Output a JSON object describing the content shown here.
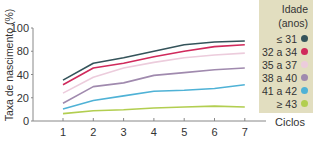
{
  "chart_data": {
    "type": "line",
    "title": "",
    "xlabel": "Ciclos",
    "ylabel": "Taxa de nascimento (%)",
    "x": [
      1,
      2,
      3,
      4,
      5,
      6,
      7
    ],
    "y_tick_labels": [
      "100",
      "80",
      "40",
      "20",
      "0"
    ],
    "ylim": [
      0,
      100
    ],
    "grid": false,
    "legend_position": "top-right",
    "legend_title": [
      "Idade",
      "(anos)"
    ],
    "series": [
      {
        "name": "≤ 31",
        "color": "#34535a",
        "values": [
          44,
          62,
          68,
          75,
          82,
          85,
          86
        ]
      },
      {
        "name": "32 a 34",
        "color": "#d02a5c",
        "values": [
          39,
          57,
          62,
          69,
          75,
          80,
          82
        ]
      },
      {
        "name": "35 a 37",
        "color": "#ecccdc",
        "values": [
          30,
          47,
          57,
          63,
          68,
          71,
          73
        ]
      },
      {
        "name": "38 a 40",
        "color": "#a08aae",
        "values": [
          19,
          37,
          41,
          49,
          52,
          55,
          57
        ]
      },
      {
        "name": "41 a 42",
        "color": "#4fb2d6",
        "values": [
          13,
          22,
          27,
          32,
          33,
          35,
          39
        ]
      },
      {
        "name": "≥ 43",
        "color": "#b2ce50",
        "values": [
          8,
          11,
          12,
          14,
          15,
          16,
          15
        ]
      }
    ]
  },
  "axes": {
    "ylabel": "Taxa de nascimento (%)",
    "xlabel": "Ciclos",
    "x_ticks": [
      "1",
      "2",
      "3",
      "4",
      "5",
      "6",
      "7"
    ],
    "y_ticks": [
      "100",
      "80",
      "40",
      "20",
      "0"
    ]
  },
  "legend": {
    "title_line1": "Idade",
    "title_line2": "(anos)",
    "items": [
      {
        "label": "≤ 31",
        "color": "#34535a"
      },
      {
        "label": "32 a 34",
        "color": "#d02a5c"
      },
      {
        "label": "35 a 37",
        "color": "#ecccdc"
      },
      {
        "label": "38 a 40",
        "color": "#a08aae"
      },
      {
        "label": "41 a 42",
        "color": "#4fb2d6"
      },
      {
        "label": "≥ 43",
        "color": "#b2ce50"
      }
    ]
  }
}
